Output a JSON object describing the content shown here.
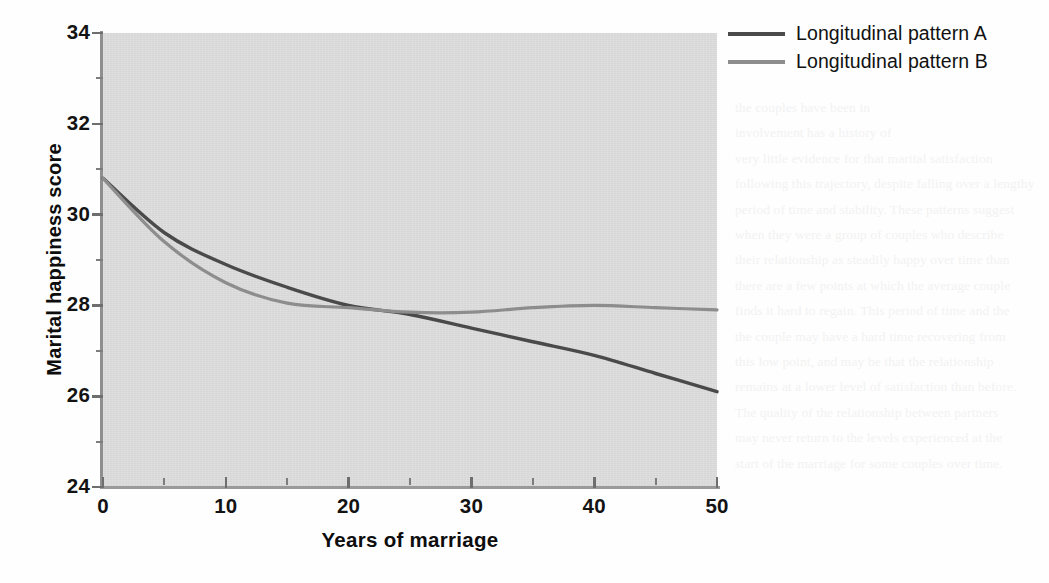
{
  "chart_data": {
    "type": "line",
    "title": "",
    "xlabel": "Years of marriage",
    "ylabel": "Marital happiness score",
    "xlim": [
      0,
      50
    ],
    "ylim": [
      24,
      34
    ],
    "xticks": [
      0,
      10,
      20,
      30,
      40,
      50
    ],
    "xtick_labels": [
      "0",
      "10",
      "20",
      "30",
      "40",
      "50"
    ],
    "x_minor_ticks": [
      5,
      15,
      25,
      35,
      45
    ],
    "yticks": [
      24,
      26,
      28,
      30,
      32,
      34
    ],
    "ytick_labels": [
      "24",
      "26",
      "28",
      "30",
      "32",
      "34"
    ],
    "y_minor_ticks": [
      25,
      27,
      29,
      31,
      33
    ],
    "grid": false,
    "legend_position": "top-right",
    "plot_background": "#d6d6d6",
    "series": [
      {
        "name": "Longitudinal pattern A",
        "color": "#4a4a4a",
        "x": [
          0,
          5,
          10,
          15,
          20,
          25,
          30,
          35,
          40,
          45,
          50
        ],
        "values": [
          30.8,
          29.6,
          28.9,
          28.4,
          28.0,
          27.8,
          27.5,
          27.2,
          26.9,
          26.5,
          26.1
        ]
      },
      {
        "name": "Longitudinal pattern B",
        "color": "#8d8d8d",
        "x": [
          0,
          5,
          10,
          15,
          20,
          25,
          30,
          35,
          40,
          45,
          50
        ],
        "values": [
          30.8,
          29.4,
          28.5,
          28.05,
          27.95,
          27.85,
          27.85,
          27.95,
          28.0,
          27.95,
          27.9
        ]
      }
    ]
  },
  "legend": {
    "items": [
      {
        "label": "Longitudinal pattern A",
        "color": "#4a4a4a"
      },
      {
        "label": "Longitudinal pattern B",
        "color": "#8d8d8d"
      }
    ]
  },
  "axes": {
    "y_title": "Marital happiness score",
    "x_title": "Years of marriage"
  },
  "ghost_text": {
    "right_column": "the couples have been in\ninvolvement has a history of\nvery little evidence for that marital satisfaction\nfollowing this trajectory, despite falling over a lengthy\nperiod of time and stability. These patterns suggest\nwhen they were a group of couples who describe\ntheir relationship as steadily happy over time than\nthere are a few points at which the average couple\nfinds it hard to regain. This period of time and the\nthe couple may have a hard time recovering from\nthis low point, and may be that the relationship\nremains at a lower level of satisfaction than before.\nThe quality of the relationship between partners\nmay never return to the levels experienced at the\nstart of the marriage for some couples over time."
  }
}
